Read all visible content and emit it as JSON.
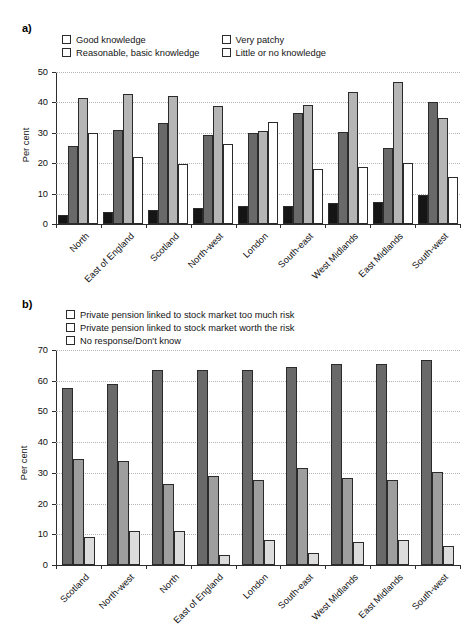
{
  "figure": {
    "panel_a_label": "a)",
    "panel_b_label": "b)"
  },
  "chart_data": [
    {
      "panel": "a)",
      "type": "bar",
      "title": "",
      "xlabel": "",
      "ylabel": "Per cent",
      "ylim": [
        0,
        50
      ],
      "yticks": [
        0,
        10,
        20,
        30,
        40,
        50
      ],
      "grid": true,
      "legend_position": "top",
      "categories": [
        "North",
        "East of England",
        "Scotland",
        "North-west",
        "London",
        "South-east",
        "West Midlands",
        "East Midlands",
        "South-west"
      ],
      "series": [
        {
          "name": "Good knowledge",
          "color": "#151515",
          "values": [
            3.0,
            4.0,
            4.5,
            5.4,
            5.8,
            5.8,
            6.8,
            7.3,
            9.7
          ]
        },
        {
          "name": "Reasonable, basic knowledge",
          "color": "#696969",
          "values": [
            25.5,
            31.0,
            33.1,
            29.4,
            29.8,
            36.4,
            30.3,
            24.9,
            40.0
          ]
        },
        {
          "name": "Very patchy",
          "color": "#b5b5b5",
          "values": [
            41.3,
            42.8,
            42.2,
            38.9,
            30.7,
            39.2,
            43.5,
            46.8,
            35.0
          ]
        },
        {
          "name": "Little or no knowledge",
          "color": "#ffffff",
          "values": [
            29.8,
            22.0,
            19.6,
            26.2,
            33.6,
            18.0,
            18.6,
            20.1,
            15.4
          ]
        }
      ]
    },
    {
      "panel": "b)",
      "type": "bar",
      "title": "",
      "xlabel": "",
      "ylabel": "Per cent",
      "ylim": [
        0,
        70
      ],
      "yticks": [
        0,
        10,
        20,
        30,
        40,
        50,
        60,
        70
      ],
      "grid": true,
      "legend_position": "top",
      "categories": [
        "Scotland",
        "North-west",
        "North",
        "East of England",
        "London",
        "South-east",
        "West Midlands",
        "East Midlands",
        "South-west"
      ],
      "series": [
        {
          "name": "Private pension linked to stock market too much risk",
          "color": "#696969",
          "values": [
            57.5,
            58.8,
            63.4,
            63.5,
            63.4,
            64.6,
            65.3,
            65.3,
            66.6
          ]
        },
        {
          "name": "Private pension linked to stock market worth the risk",
          "color": "#9e9e9e",
          "values": [
            34.5,
            33.8,
            26.5,
            29.1,
            27.7,
            31.7,
            28.4,
            27.6,
            30.4
          ]
        },
        {
          "name": "No response/Don't know",
          "color": "#dcdcdc",
          "values": [
            9.0,
            11.0,
            11.0,
            3.4,
            8.2,
            4.0,
            7.4,
            8.1,
            6.1
          ]
        }
      ]
    }
  ]
}
